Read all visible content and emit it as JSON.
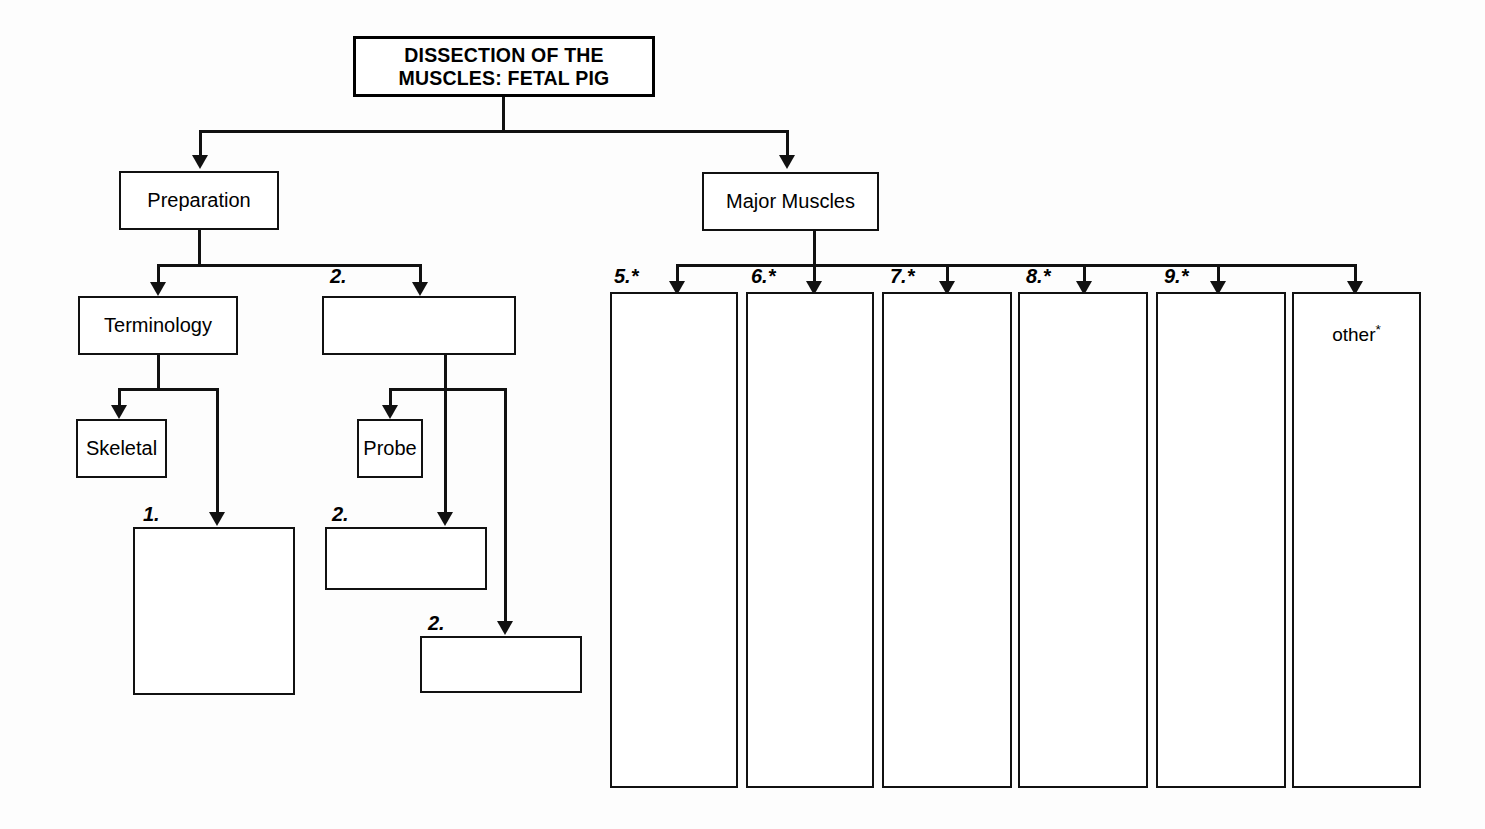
{
  "diagram": {
    "title_box": {
      "label": "DISSECTION OF THE\nMUSCLES:  FETAL PIG"
    },
    "level2": [
      {
        "name": "preparation",
        "label": "Preparation"
      },
      {
        "name": "major-muscles",
        "label": "Major Muscles"
      }
    ],
    "preparation_children": [
      {
        "name": "terminology",
        "label": "Terminology"
      },
      {
        "name": "prep-blank-2",
        "label": "",
        "caption": "2."
      }
    ],
    "terminology_children": [
      {
        "name": "skeletal",
        "label": "Skeletal"
      },
      {
        "name": "terminology-blank-1",
        "label": "",
        "caption": "1."
      }
    ],
    "prep_blank_children": [
      {
        "name": "probe",
        "label": "Probe"
      },
      {
        "name": "probe-blank-a",
        "label": "",
        "caption": "2."
      },
      {
        "name": "probe-blank-b",
        "label": "",
        "caption": "2."
      }
    ],
    "muscle_columns": [
      {
        "name": "muscle-column-5",
        "caption": "5.",
        "caption_star": "*",
        "label": ""
      },
      {
        "name": "muscle-column-6",
        "caption": "6.",
        "caption_star": "*",
        "label": ""
      },
      {
        "name": "muscle-column-7",
        "caption": "7.",
        "caption_star": "*",
        "label": ""
      },
      {
        "name": "muscle-column-8",
        "caption": "8.",
        "caption_star": "*",
        "label": ""
      },
      {
        "name": "muscle-column-9",
        "caption": "9.",
        "caption_star": "*",
        "label": ""
      },
      {
        "name": "muscle-column-other",
        "caption": "",
        "caption_star": "",
        "label": "other",
        "label_star": "*"
      }
    ],
    "colors": {
      "line": "#111111",
      "box_fill": "#ffffff",
      "text": "#000000",
      "background": "#fdfdfd"
    }
  }
}
